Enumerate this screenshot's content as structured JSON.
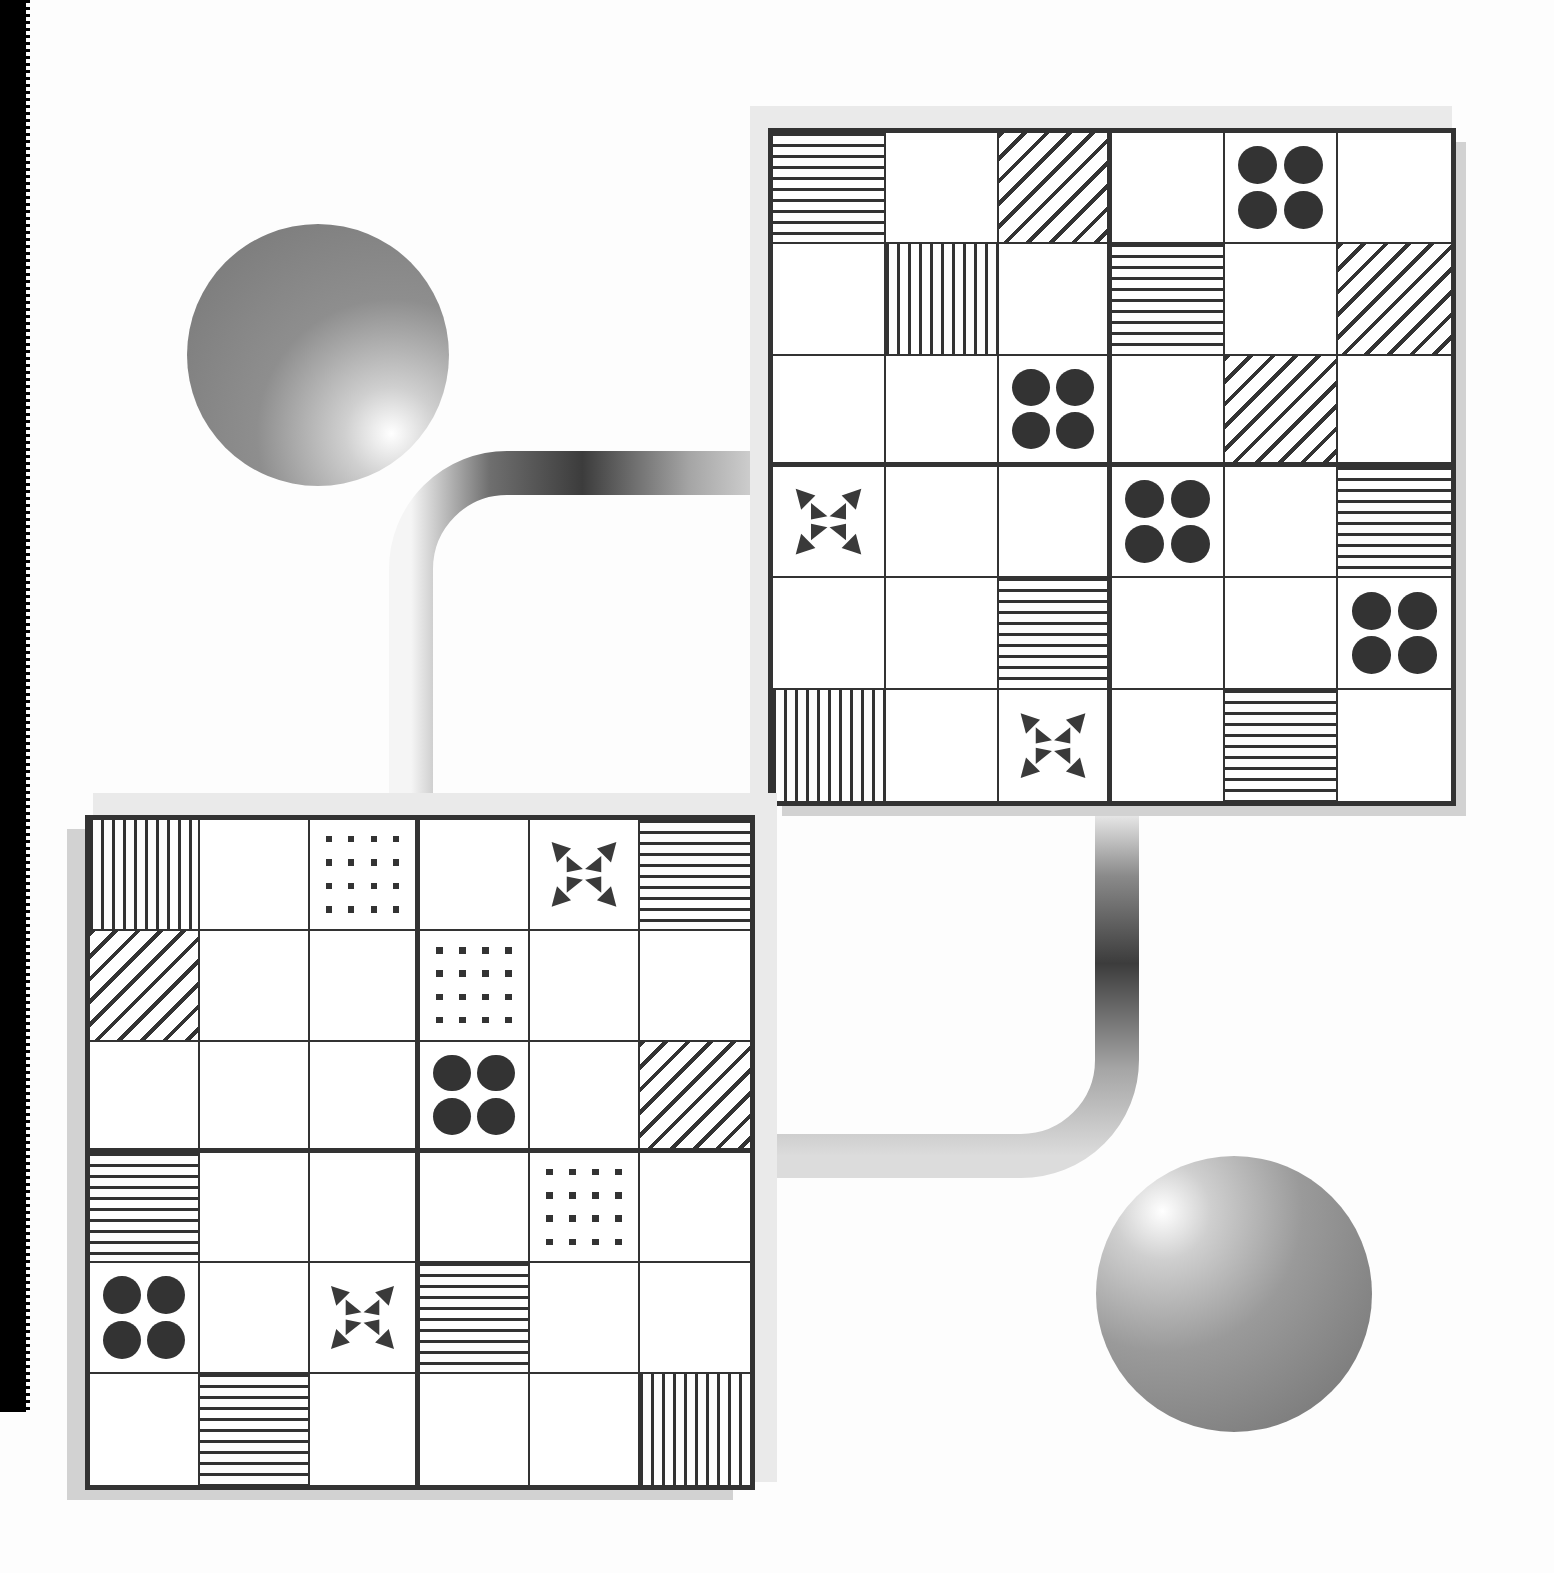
{
  "page": {
    "background_color": "#fdfdfd",
    "ink_color": "#333333",
    "scan_edge_color": "#000000",
    "shadow_color": "#d2d2d2",
    "shadow_color_light": "#eaeaea"
  },
  "legend": {
    "symbols": [
      {
        "key": "empty",
        "label": "blank cell"
      },
      {
        "key": "hlines",
        "label": "horizontal-stripes-pattern"
      },
      {
        "key": "vlines",
        "label": "vertical-stripes-pattern"
      },
      {
        "key": "diag",
        "label": "diagonal-hatch-pattern"
      },
      {
        "key": "dots",
        "label": "four-dots-pattern"
      },
      {
        "key": "checker",
        "label": "sixteen-squares-pattern"
      },
      {
        "key": "arrows",
        "label": "eight-triangles-pinwheel-pattern"
      }
    ]
  },
  "spheres": [
    {
      "name": "sphere-top-left",
      "cx": 318,
      "cy": 355,
      "r": 131,
      "highlight": "bottom-right",
      "base_color": "#8e8e8e",
      "highlight_color": "#ffffff"
    },
    {
      "name": "sphere-bottom-right",
      "cx": 1234,
      "cy": 1294,
      "r": 138,
      "highlight": "top-left",
      "base_color": "#9a9a9a",
      "highlight_color": "#ffffff"
    }
  ],
  "pipes": [
    {
      "name": "pipe-upper-elbow",
      "shape": "elbow-right-down",
      "thickness": 42,
      "from": "top-right-grid-left-edge",
      "to": "bottom-left-grid-top-edge",
      "gradient": [
        "#f2f2f2",
        "#4a4a4a",
        "#c9c9c9"
      ]
    },
    {
      "name": "pipe-lower-elbow",
      "shape": "elbow-down-left",
      "thickness": 42,
      "from": "top-right-grid-bottom-edge",
      "to": "bottom-left-grid-right-edge",
      "gradient": [
        "#f2f2f2",
        "#4a4a4a",
        "#c9c9c9"
      ]
    }
  ],
  "grids": [
    {
      "name": "top-right-grid",
      "x": 768,
      "y": 128,
      "w": 688,
      "h": 678,
      "rows": 6,
      "cols": 6,
      "block_rows": 3,
      "block_cols": 3,
      "cells": [
        [
          "hlines",
          "empty",
          "diag",
          "empty",
          "dots",
          "empty"
        ],
        [
          "empty",
          "vlines",
          "empty",
          "hlines",
          "empty",
          "diag"
        ],
        [
          "empty",
          "empty",
          "dots",
          "empty",
          "diag",
          "empty"
        ],
        [
          "arrows",
          "empty",
          "empty",
          "dots",
          "empty",
          "hlines"
        ],
        [
          "empty",
          "empty",
          "hlines",
          "empty",
          "empty",
          "dots"
        ],
        [
          "vlines",
          "empty",
          "arrows",
          "empty",
          "hlines",
          "empty"
        ]
      ]
    },
    {
      "name": "bottom-left-grid",
      "x": 85,
      "y": 815,
      "w": 670,
      "h": 675,
      "rows": 6,
      "cols": 6,
      "block_rows": 3,
      "block_cols": 3,
      "cells": [
        [
          "vlines",
          "empty",
          "checker",
          "empty",
          "arrows",
          "hlines"
        ],
        [
          "diag",
          "empty",
          "empty",
          "checker",
          "empty",
          "empty"
        ],
        [
          "empty",
          "empty",
          "empty",
          "dots",
          "empty",
          "diag"
        ],
        [
          "hlines",
          "empty",
          "empty",
          "empty",
          "checker",
          "empty"
        ],
        [
          "dots",
          "empty",
          "arrows",
          "hlines",
          "empty",
          "empty"
        ],
        [
          "empty",
          "hlines",
          "empty",
          "empty",
          "empty",
          "vlines"
        ]
      ]
    }
  ]
}
